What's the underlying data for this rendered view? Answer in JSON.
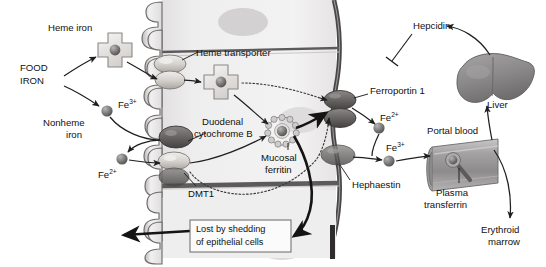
{
  "figure": {
    "background_color": "#ffffff"
  },
  "palette": {
    "cell_fill": "#eceaea",
    "cell_fill_light": "#f3f2f2",
    "membrane_dark": "#4c4c4c",
    "nucleus": "#cfcdcd",
    "protein_light": "#d8d5d2",
    "protein_dark": "#6d6a6a",
    "iron_sphere": "#7a7777",
    "organ_gray": "#8e8c8c",
    "text": "#111111",
    "arrow": "#1f1f1f"
  },
  "labels": {
    "food_iron_line1": "FOOD",
    "food_iron_line2": "IRON",
    "heme_iron": "Heme iron",
    "nonheme_iron_line1": "Nonheme",
    "nonheme_iron_line2": "iron",
    "fe3_top": "Fe",
    "fe3_top_sup": "3+",
    "fe2_left": "Fe",
    "fe2_left_sup": "2+",
    "heme_transporter": "Heme transporter",
    "dcytb_line1": "Duodenal",
    "dcytb_line2": "cytochrome B",
    "dmt1": "DMT1",
    "mucosal_ferritin_line1": "Mucosal",
    "mucosal_ferritin_line2": "ferritin",
    "shedding_line1": "Lost by shedding",
    "shedding_line2": "of epithelial cells",
    "ferroportin": "Ferroportin 1",
    "hephaestin": "Hephaestin",
    "fe2_right": "Fe",
    "fe2_right_sup": "2+",
    "fe3_right": "Fe",
    "fe3_right_sup": "3+",
    "hepcidin": "Hepcidin",
    "liver": "Liver",
    "portal_blood": "Portal blood",
    "plasma_transferrin_line1": "Plasma",
    "plasma_transferrin_line2": "transferrin",
    "erythroid_marrow_line1": "Erythroid",
    "erythroid_marrow_line2": "marrow"
  },
  "icons": {
    "heme_molecule": "heme-cross-icon",
    "iron_atom": "iron-sphere-icon",
    "ferritin_shell": "ferritin-shell-icon",
    "liver_organ": "liver-icon",
    "blood_vessel": "portal-vessel-icon",
    "transferrin": "transferrin-icon",
    "inhibition_marker": "inhibition-tbar-icon",
    "membrane_channel": "transport-protein-icon"
  },
  "structures": {
    "epithelium": "duodenal-enterocyte-epithelium",
    "brush_border": "microvilli-brush-border",
    "basolateral": "basolateral-membrane"
  }
}
